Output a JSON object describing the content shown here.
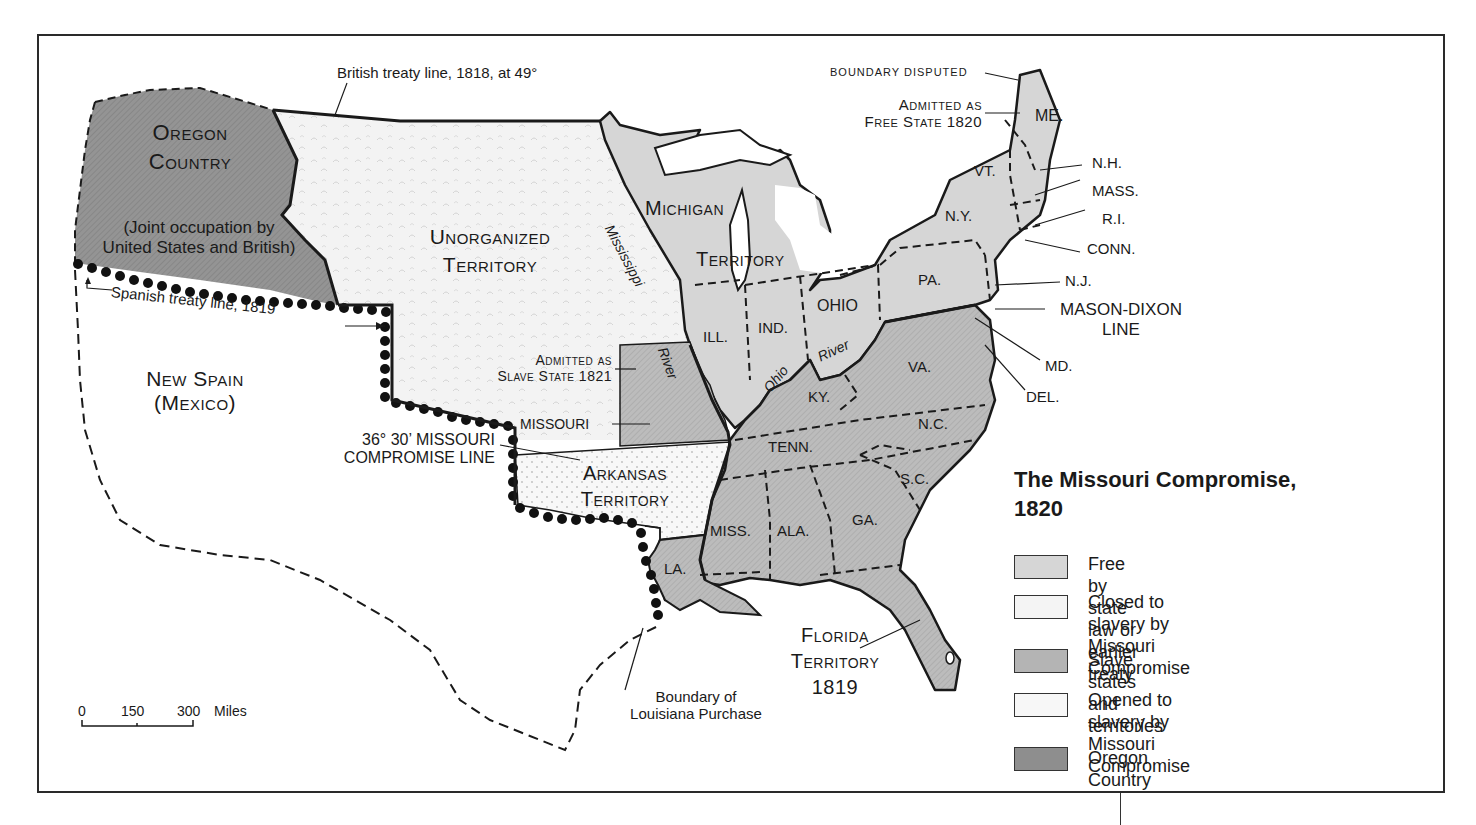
{
  "map": {
    "title_line1": "The Missouri Compromise,",
    "title_line2": "1820",
    "colors": {
      "free": "#d6d6d6",
      "closed": "#f4f4f4",
      "slave": "#b4b4b4",
      "opened": "#f7f7f7",
      "oregon": "#8e8e8e",
      "outline": "#1a1a1a"
    },
    "legend": [
      {
        "key": "free",
        "label": "Free by state law or earlier treaty"
      },
      {
        "key": "closed",
        "label_line1": "Closed to slavery by",
        "label_line2": "Missouri Compromise"
      },
      {
        "key": "slave",
        "label": "Slave states and territories"
      },
      {
        "key": "opened",
        "label_line1": "Opened to slavery by",
        "label_line2": "Missouri Compromise"
      },
      {
        "key": "oregon",
        "label": "Oregon Country"
      }
    ],
    "regions": {
      "oregon_line1": "Oregon",
      "oregon_line2": "Country",
      "oregon_note_line1": "(Joint occupation by",
      "oregon_note_line2": "United States and British)",
      "unorganized_line1": "Unorganized",
      "unorganized_line2": "Territory",
      "new_spain_line1": "New Spain",
      "new_spain_line2": "(Mexico)",
      "michigan_line1": "Michigan",
      "michigan_line2": "Territory",
      "arkansas_line1": "Arkansas",
      "arkansas_line2": "Territory",
      "florida_line1": "Florida",
      "florida_line2": "Territory",
      "florida_line3": "1819"
    },
    "states": {
      "me": "ME.",
      "vt": "VT.",
      "nh": "N.H.",
      "mass": "MASS.",
      "ri": "R.I.",
      "conn": "CONN.",
      "ny": "N.Y.",
      "pa": "PA.",
      "nj": "N.J.",
      "md": "MD.",
      "del": "DEL.",
      "va": "VA.",
      "nc": "N.C.",
      "sc": "S.C.",
      "ga": "GA.",
      "ala": "ALA.",
      "miss": "MISS.",
      "la": "LA.",
      "tenn": "TENN.",
      "ky": "KY.",
      "ohio": "OHIO",
      "ind": "IND.",
      "ill": "ILL.",
      "missouri": "MISSOURI"
    },
    "annotations": {
      "british_treaty": "British treaty line, 1818, at 49°",
      "boundary_disputed": "Boundary disputed",
      "admitted_free_line1": "Admitted as",
      "admitted_free_line2": "Free State 1820",
      "admitted_slave_line1": "Admitted as",
      "admitted_slave_line2": "Slave State 1821",
      "spanish_treaty": "Spanish treaty line, 1819",
      "compromise_line1": "36°  30’ MISSOURI",
      "compromise_line2": "COMPROMISE LINE",
      "mason_dixon_line1": "MASON-DIXON",
      "mason_dixon_line2": "LINE",
      "louisiana_line1": "Boundary of",
      "louisiana_line2": "Louisiana Purchase",
      "mississippi": "Mississippi",
      "river1": "River",
      "ohio": "Ohio",
      "river2": "River"
    },
    "scale": {
      "t0": "0",
      "t1": "150",
      "t2": "300",
      "unit": "Miles"
    }
  }
}
